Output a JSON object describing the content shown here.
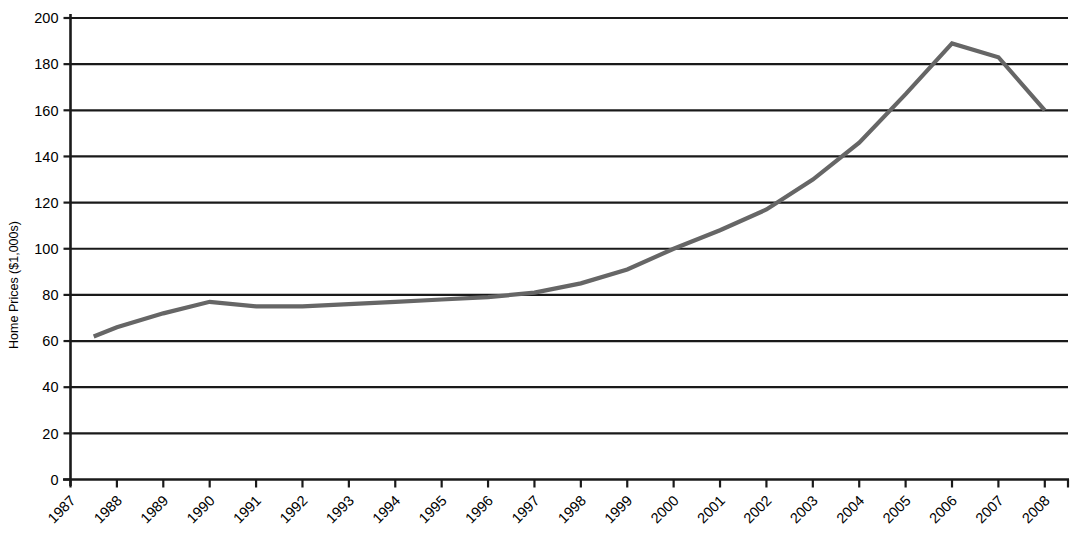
{
  "chart_data": {
    "type": "line",
    "title": "",
    "xlabel": "",
    "ylabel": "Home Prices ($1,000s)",
    "xlim": [
      1987,
      2008.5
    ],
    "ylim": [
      0,
      200
    ],
    "grid": true,
    "legend": "none",
    "line_color": "#666666",
    "axis_color": "#1a1a1a",
    "background": "#ffffff",
    "ytick_labels": [
      "200",
      "180",
      "160",
      "140",
      "120",
      "100",
      "80",
      "60",
      "40",
      "20",
      "0"
    ],
    "ytick_values": [
      200,
      180,
      160,
      140,
      120,
      100,
      80,
      60,
      40,
      20,
      0
    ],
    "xtick_labels": [
      "1987",
      "1988",
      "1989",
      "1990",
      "1991",
      "1992",
      "1993",
      "1994",
      "1995",
      "1996",
      "1997",
      "1998",
      "1999",
      "2000",
      "2001",
      "2002",
      "2003",
      "2004",
      "2005",
      "2006",
      "2007",
      "2008"
    ],
    "categories": [
      1987,
      1988,
      1989,
      1990,
      1991,
      1992,
      1993,
      1994,
      1995,
      1996,
      1997,
      1998,
      1999,
      2000,
      2001,
      2002,
      2003,
      2004,
      2005,
      2006,
      2007,
      2008
    ],
    "x": [
      1987.5,
      1988,
      1989,
      1990,
      1991,
      1992,
      1993,
      1994,
      1995,
      1996,
      1997,
      1998,
      1999,
      2000,
      2001,
      2002,
      2003,
      2004,
      2005,
      2006,
      2007,
      2008
    ],
    "values": [
      62,
      66,
      72,
      77,
      75,
      75,
      76,
      77,
      78,
      79,
      81,
      85,
      91,
      100,
      108,
      117,
      130,
      146,
      167,
      189,
      183,
      160
    ],
    "series": [
      {
        "name": "Home Prices",
        "values": [
          62,
          66,
          72,
          77,
          75,
          75,
          76,
          77,
          78,
          79,
          81,
          85,
          91,
          100,
          108,
          117,
          130,
          146,
          167,
          189,
          183,
          160
        ]
      }
    ]
  }
}
